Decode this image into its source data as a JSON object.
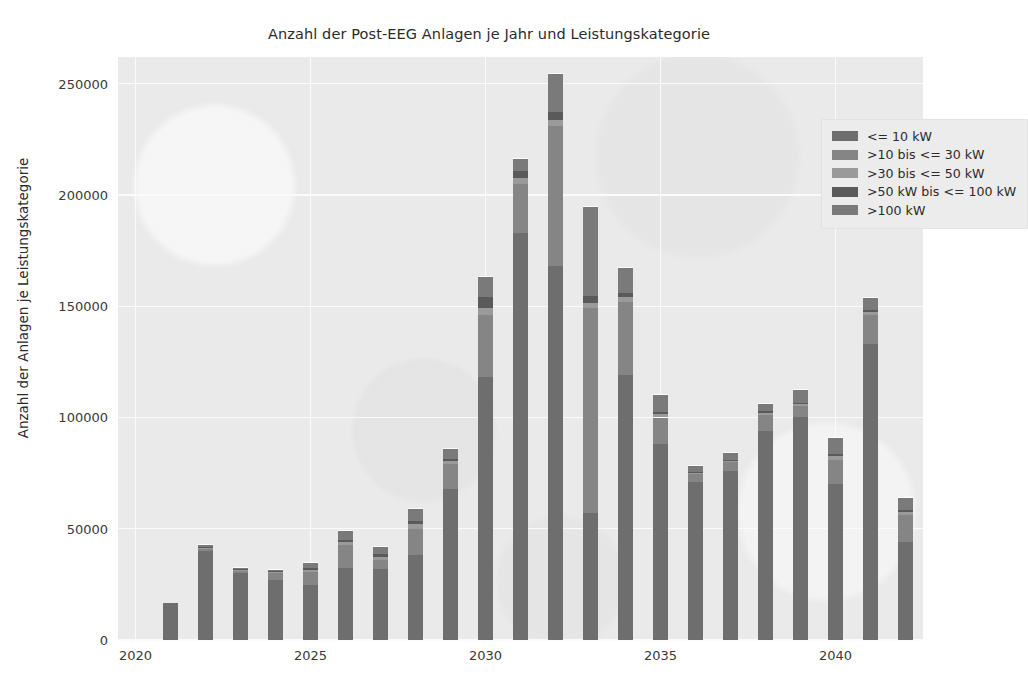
{
  "title": "Anzahl der Post-EEG Anlagen je Jahr und Leistungskategorie",
  "axes": {
    "ylabel": "Anzahl der Anlagen je Leistungskategorie",
    "xlabel": "",
    "yticks": [
      "0",
      "50000",
      "100000",
      "150000",
      "200000",
      "250000"
    ],
    "xticks": [
      "2020",
      "2025",
      "2030",
      "2035",
      "2040"
    ]
  },
  "legend": {
    "position": "upper right",
    "items": [
      {
        "label": "<= 10 kW",
        "color": "#6e6e6e"
      },
      {
        "label": ">10 bis <= 30 kW",
        "color": "#858585"
      },
      {
        "label": ">30 bis <= 50 kW",
        "color": "#9a9a9a"
      },
      {
        "label": ">50 kW bis <= 100 kW",
        "color": "#5a5a5a"
      },
      {
        "label": ">100 kW",
        "color": "#7a7a7a"
      }
    ]
  },
  "chart_data": {
    "type": "bar",
    "subtype": "stacked",
    "title": "Anzahl der Post-EEG Anlagen je Jahr und Leistungskategorie",
    "xlabel": "",
    "ylabel": "Anzahl der Anlagen je Leistungskategorie",
    "xlim": [
      2019.5,
      2042.5
    ],
    "ylim": [
      0,
      262000
    ],
    "grid": true,
    "legend_position": "upper right",
    "categories": [
      2020,
      2021,
      2022,
      2023,
      2024,
      2025,
      2026,
      2027,
      2028,
      2029,
      2030,
      2031,
      2032,
      2033,
      2034,
      2035,
      2036,
      2037,
      2038,
      2039,
      2040,
      2041,
      2042
    ],
    "series": [
      {
        "name": "<= 10 kW",
        "color": "#6e6e6e",
        "values": [
          0,
          16500,
          40000,
          30000,
          27000,
          24500,
          32500,
          32000,
          38000,
          68000,
          118000,
          183000,
          168000,
          57000,
          119000,
          88000,
          71000,
          76000,
          94000,
          100000,
          70000,
          133000,
          44000
        ]
      },
      {
        "name": ">10 bis <= 30 kW",
        "color": "#858585",
        "values": [
          0,
          0,
          1000,
          1000,
          3000,
          6000,
          10000,
          4000,
          12000,
          11000,
          28000,
          22000,
          63000,
          92000,
          33000,
          12000,
          3500,
          4000,
          7000,
          5000,
          11000,
          13000,
          12000
        ]
      },
      {
        "name": ">30 bis <= 50 kW",
        "color": "#9a9a9a",
        "values": [
          0,
          0,
          500,
          500,
          500,
          1000,
          1500,
          1500,
          2000,
          1500,
          3000,
          2500,
          2500,
          2500,
          2000,
          1500,
          500,
          500,
          1000,
          1000,
          1500,
          1500,
          1500
        ]
      },
      {
        "name": ">50 kW bis <= 100 kW",
        "color": "#5a5a5a",
        "values": [
          0,
          0,
          300,
          300,
          300,
          700,
          1000,
          1000,
          1500,
          1000,
          5000,
          3500,
          4000,
          3000,
          2000,
          1000,
          500,
          500,
          700,
          700,
          1000,
          1000,
          1000
        ]
      },
      {
        "name": ">100 kW",
        "color": "#7a7a7a",
        "values": [
          0,
          0,
          700,
          700,
          700,
          2500,
          4000,
          3500,
          5500,
          4500,
          9000,
          5000,
          17000,
          40000,
          11000,
          7500,
          2500,
          3000,
          3500,
          5500,
          7500,
          5000,
          5500
        ]
      }
    ],
    "totals": [
      0,
      16500,
      42500,
      32500,
      31500,
      34700,
      49000,
      42000,
      59000,
      86000,
      163000,
      216000,
      254500,
      194500,
      167000,
      110000,
      78000,
      84000,
      106200,
      112200,
      91000,
      153500,
      64000
    ]
  }
}
